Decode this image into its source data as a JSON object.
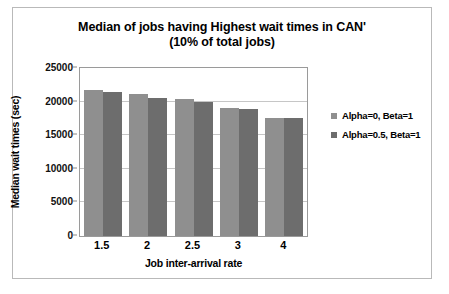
{
  "chart_data": {
    "type": "bar",
    "title": "Median of jobs having Highest wait times in CAN'",
    "subtitle": "(10% of total jobs)",
    "title_line1": "Median of jobs having Highest wait times in CAN'",
    "title_line2": "(10% of total jobs)",
    "xlabel": "Job inter-arrival rate",
    "ylabel": "Median wait times (sec)",
    "categories": [
      "1.5",
      "2",
      "2.5",
      "3",
      "4"
    ],
    "series": [
      {
        "name": "Alpha=0, Beta=1",
        "color": "#8f8f8f",
        "values": [
          21800,
          21100,
          20400,
          19000,
          17600
        ]
      },
      {
        "name": "Alpha=0.5, Beta=1",
        "color": "#6d6d6d",
        "values": [
          21400,
          20600,
          20000,
          18900,
          17500
        ]
      }
    ],
    "ylim": [
      0,
      25000
    ],
    "ytick_values": [
      0,
      5000,
      10000,
      15000,
      20000,
      25000
    ],
    "ytick_labels": [
      "0",
      "5000",
      "10000",
      "15000",
      "20000",
      "25000"
    ],
    "grid": true,
    "legend_position": "right"
  },
  "legend": {
    "entries": [
      {
        "label": "Alpha=0, Beta=1"
      },
      {
        "label": "Alpha=0.5, Beta=1"
      }
    ]
  }
}
